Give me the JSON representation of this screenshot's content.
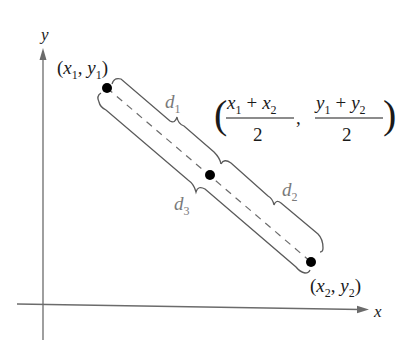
{
  "diagram": {
    "type": "midpoint-formula-illustration",
    "axes": {
      "x_label": "x",
      "y_label": "y"
    },
    "points": [
      {
        "id": "p1",
        "label_var_x": "x",
        "label_sub_x": "1",
        "label_var_y": "y",
        "label_sub_y": "1",
        "px": [
          107,
          88
        ]
      },
      {
        "id": "midpoint",
        "px": [
          210,
          175
        ]
      },
      {
        "id": "p2",
        "label_var_x": "x",
        "label_sub_x": "2",
        "label_var_y": "y",
        "label_sub_y": "2",
        "px": [
          311,
          262
        ]
      }
    ],
    "distances": {
      "d1": {
        "var": "d",
        "sub": "1"
      },
      "d2": {
        "var": "d",
        "sub": "2"
      },
      "d3": {
        "var": "d",
        "sub": "3"
      }
    },
    "midpoint_label": {
      "num_left_a": "x",
      "num_left_a_sub": "1",
      "num_left_op": "+",
      "num_left_b": "x",
      "num_left_b_sub": "2",
      "den_left": "2",
      "separator": ",",
      "num_right_a": "y",
      "num_right_a_sub": "1",
      "num_right_op": "+",
      "num_right_b": "y",
      "num_right_b_sub": "2",
      "den_right": "2",
      "open_paren": "(",
      "close_paren": ")"
    },
    "colors": {
      "axis": "#6b6b6b",
      "brace": "#5a5a5a",
      "dashed": "#6b6b6b",
      "distance_label": "#7a7a7a",
      "point": "#000000",
      "text": "#1a1a1a"
    }
  }
}
